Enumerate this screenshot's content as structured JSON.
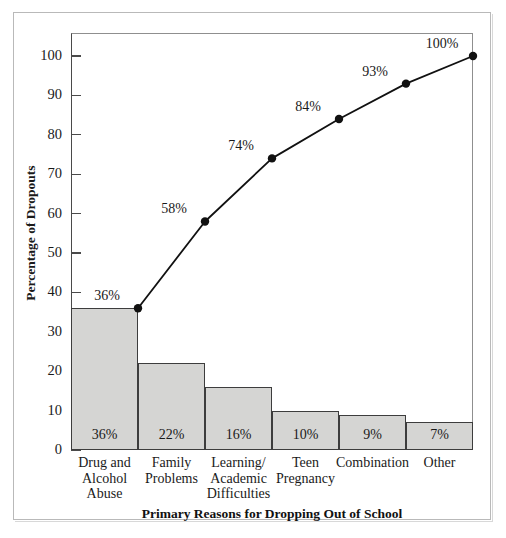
{
  "figure": {
    "bottom_cut_caption": "",
    "plot": {
      "left": 71,
      "right": 473,
      "top": 33,
      "zero_y": 450
    }
  },
  "chart_data": {
    "type": "bar",
    "title": "",
    "subtitle": "",
    "xlabel": "Primary Reasons for Dropping Out of School",
    "ylabel": "Percentage of Dropouts",
    "categories": [
      "Drug and Alcohol Abuse",
      "Family Problems",
      "Learning/ Academic Difficulties",
      "Teen Pregnancy",
      "Combination",
      "Other"
    ],
    "category_lines": [
      [
        "Drug and",
        "Alcohol",
        "Abuse"
      ],
      [
        "Family",
        "Problems"
      ],
      [
        "Learning/",
        "Academic",
        "Difficulties"
      ],
      [
        "Teen",
        "Pregnancy"
      ],
      [
        "Combination"
      ],
      [
        "Other"
      ]
    ],
    "values": [
      36,
      22,
      16,
      10,
      9,
      7
    ],
    "bar_labels": [
      "36%",
      "22%",
      "16%",
      "10%",
      "9%",
      "7%"
    ],
    "series": [
      {
        "name": "Percentage of Dropouts",
        "type": "bar",
        "values": [
          36,
          22,
          16,
          10,
          9,
          7
        ]
      },
      {
        "name": "Cumulative Percentage",
        "type": "line",
        "values": [
          36,
          58,
          74,
          84,
          93,
          100
        ],
        "point_labels": [
          "36%",
          "58%",
          "74%",
          "84%",
          "93%",
          "100%"
        ]
      }
    ],
    "ylim": [
      0,
      100
    ],
    "ytick_values": [
      0,
      10,
      20,
      30,
      40,
      50,
      60,
      70,
      80,
      90,
      100
    ],
    "ytick_labels": [
      "0",
      "10",
      "20",
      "30",
      "40",
      "50",
      "60",
      "70",
      "80",
      "90",
      "100"
    ],
    "grid": false,
    "legend": "none",
    "colors": {
      "bar_fill": "#d5d5d3",
      "bar_edge": "#3d3d3d",
      "line": "#111111",
      "marker": "#111111",
      "axis": "#4a4a4a",
      "text": "#1a1a1a",
      "frame": "#b9b9b9"
    }
  }
}
